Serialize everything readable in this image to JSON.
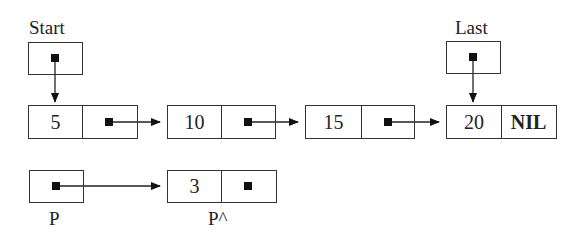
{
  "diagram": {
    "type": "linked-list",
    "labels": {
      "start": "Start",
      "last": "Last",
      "p": "P",
      "p_deref": "P^"
    },
    "nodes": [
      {
        "value": "5",
        "next": "pointer"
      },
      {
        "value": "10",
        "next": "pointer"
      },
      {
        "value": "15",
        "next": "pointer"
      },
      {
        "value": "20",
        "next": "NIL"
      }
    ],
    "new_node": {
      "value": "3",
      "next": "pointer"
    },
    "colors": {
      "line": "#333333",
      "background": "#ffffff",
      "text": "#222222"
    }
  }
}
